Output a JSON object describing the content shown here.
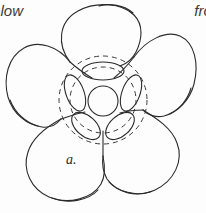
{
  "figure": {
    "alt_title": "flower viewed from above, line drawing",
    "part_label": "a.",
    "ink_color": "#2b2b2b",
    "background_color": "#fdfdfd",
    "stroke_width": 1.1,
    "dashed_stroke_width": 1.0,
    "dash_pattern": "5 4"
  },
  "caption": {
    "left_fragment": "elow",
    "right_fragment": "fro"
  },
  "structures": {
    "petal_count": 5,
    "stamen_count": 5,
    "center_label": "central disc",
    "ring_label": "dashed corolla ring"
  }
}
